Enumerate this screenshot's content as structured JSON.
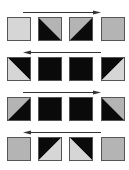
{
  "colors": {
    "black": "#0a0a0a",
    "light": "#d6d6d6",
    "mid": "#b4b4b4",
    "border": "#555555",
    "arrow": "#333333"
  },
  "rows": [
    {
      "arrow_direction": "right",
      "cells": [
        {
          "type": "solid",
          "fill": "light"
        },
        {
          "type": "split",
          "diagonal": "tl-br",
          "upper": "mid",
          "lower": "black"
        },
        {
          "type": "split",
          "diagonal": "tr-bl",
          "upper": "mid",
          "lower": "black"
        },
        {
          "type": "solid",
          "fill": "mid"
        }
      ]
    },
    {
      "arrow_direction": "left",
      "cells": [
        {
          "type": "split",
          "diagonal": "tl-br",
          "upper": "black",
          "lower": "light"
        },
        {
          "type": "solid",
          "fill": "black"
        },
        {
          "type": "solid",
          "fill": "black"
        },
        {
          "type": "split",
          "diagonal": "tr-bl",
          "upper": "black",
          "lower": "light"
        }
      ]
    },
    {
      "arrow_direction": "right",
      "cells": [
        {
          "type": "split",
          "diagonal": "tr-bl",
          "upper": "mid",
          "lower": "black"
        },
        {
          "type": "solid",
          "fill": "black"
        },
        {
          "type": "solid",
          "fill": "black"
        },
        {
          "type": "split",
          "diagonal": "tl-br",
          "upper": "mid",
          "lower": "black"
        }
      ]
    },
    {
      "arrow_direction": "left",
      "cells": [
        {
          "type": "solid",
          "fill": "mid"
        },
        {
          "type": "split",
          "diagonal": "tr-bl",
          "upper": "black",
          "lower": "light"
        },
        {
          "type": "split",
          "diagonal": "tl-br",
          "upper": "black",
          "lower": "light"
        },
        {
          "type": "solid",
          "fill": "mid"
        }
      ]
    }
  ]
}
